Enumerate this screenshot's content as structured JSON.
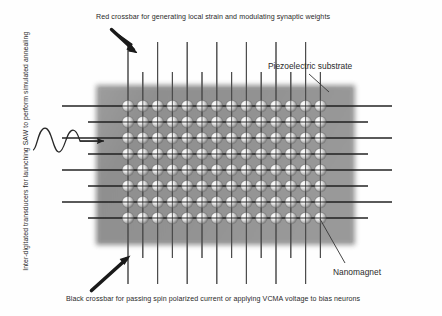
{
  "figure": {
    "width": 442,
    "height": 316,
    "background_color": "#ffffff"
  },
  "labels": {
    "top": "Red crossbar for generating local strain and modulating synaptic weights",
    "bottom": "Black crossbar for passing spin polarized current  or applying VCMA voltage to bias neurons",
    "right_top": "Piezoelectric substrate",
    "right_bottom": "Nanomagnet",
    "left_vertical": "Inter-digitated transducers for launching SAW to perform simulated annealing"
  },
  "colors": {
    "substrate_fill": "#8e8e8e",
    "substrate_edge": "#a8a8a8",
    "vertical_line": "#4a4a4a",
    "horizontal_line": "#1c1c1c",
    "arrow_black": "#1a1a1a",
    "leader_line": "#3a3a3a",
    "nanomagnet_light": "#f2f2f2",
    "nanomagnet_dark": "#6b6b6b",
    "text": "#2a2a2a",
    "wave": "#262626"
  },
  "substrate": {
    "name": "Piezoelectric substrate",
    "x": 96,
    "y": 85,
    "width": 259,
    "height": 160
  },
  "array": {
    "columns": 14,
    "rows": 8,
    "x_start": 128,
    "x_spacing": 14.8,
    "y_start": 106,
    "y_spacing": 16.0,
    "magnet_radius": 5.6,
    "total_nanomagnets": 112
  },
  "crossbars": {
    "vertical": {
      "name": "Black crossbar for passing spin polarized current or applying VCMA voltage to bias neurons",
      "count": 14,
      "top_extent_short": 72,
      "top_extent_long": 42,
      "bottom_extent_short": 258,
      "bottom_extent_long": 284
    },
    "horizontal": {
      "name": "Red crossbar for generating local strain and modulating synaptic weights",
      "count": 8,
      "left_extent_short": 88,
      "left_extent_long": 62,
      "right_extent_short": 368,
      "right_extent_long": 392
    }
  },
  "annotations": {
    "arrow_top": {
      "name": "top-arrow",
      "x1": 112,
      "y1": 30,
      "x2": 137,
      "y2": 53
    },
    "arrow_bottom": {
      "name": "bottom-arrow",
      "x1": 92,
      "y1": 290,
      "x2": 130,
      "y2": 256
    },
    "leader_piezo": {
      "name": "piezo-leader",
      "x1": 328,
      "y1": 92,
      "x2": 310,
      "y2": 76
    },
    "leader_nanomagnet": {
      "name": "nanomagnet-leader",
      "x1": 320,
      "y1": 220,
      "x2": 344,
      "y2": 262
    },
    "saw_wave": {
      "name": "saw-wave",
      "cycles": 1.5,
      "arrow_tip_x": 106,
      "arrow_y": 141
    }
  }
}
